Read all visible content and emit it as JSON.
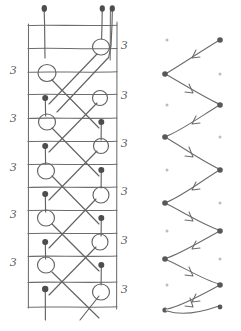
{
  "figure": {
    "ink_color": "#6a6a6a",
    "dark_node_color": "#4a4a4a",
    "faint_node_color": "#b9b9b9",
    "background": "#ffffff"
  },
  "left_panel": {
    "name": "braid-ladder",
    "grid": {
      "x_left": 28,
      "x_right": 117,
      "y_top": 25,
      "y_bottom": 307,
      "rung_count": 12,
      "rung_ys": [
        25,
        48,
        72,
        94,
        118,
        141,
        164,
        187,
        210,
        233,
        256,
        282,
        307
      ],
      "rail_xs": [
        28,
        117
      ],
      "extra_rail_x": 110
    },
    "top_stubs": [
      {
        "x": 44,
        "y_top": 10,
        "y_bottom": 25,
        "dot": true
      },
      {
        "x": 102,
        "y_top": 10,
        "y_bottom": 25,
        "dot": true
      },
      {
        "x": 112,
        "y_top": 10,
        "y_bottom": 25,
        "dot": true
      }
    ],
    "loops": [
      {
        "cx": 101,
        "cy": 47,
        "r": 8,
        "side": "right"
      },
      {
        "cx": 47,
        "cy": 73,
        "r": 9,
        "side": "left"
      },
      {
        "cx": 100,
        "cy": 98,
        "r": 7,
        "side": "right"
      },
      {
        "cx": 47,
        "cy": 122,
        "r": 8,
        "side": "left"
      },
      {
        "cx": 101,
        "cy": 146,
        "r": 7,
        "side": "right"
      },
      {
        "cx": 46,
        "cy": 171,
        "r": 8,
        "side": "left"
      },
      {
        "cx": 101,
        "cy": 195,
        "r": 8,
        "side": "right"
      },
      {
        "cx": 46,
        "cy": 218,
        "r": 8,
        "side": "left"
      },
      {
        "cx": 100,
        "cy": 242,
        "r": 8,
        "side": "right"
      },
      {
        "cx": 46,
        "cy": 265,
        "r": 8,
        "side": "left"
      },
      {
        "cx": 101,
        "cy": 292,
        "r": 8,
        "side": "right"
      }
    ],
    "filled_nodes": [
      {
        "x": 44,
        "y": 8
      },
      {
        "x": 102,
        "y": 8
      },
      {
        "x": 112,
        "y": 8
      },
      {
        "x": 45,
        "y": 98
      },
      {
        "x": 101,
        "y": 122
      },
      {
        "x": 45,
        "y": 146
      },
      {
        "x": 101,
        "y": 170
      },
      {
        "x": 45,
        "y": 194
      },
      {
        "x": 101,
        "y": 218
      },
      {
        "x": 45,
        "y": 242
      },
      {
        "x": 101,
        "y": 265
      },
      {
        "x": 45,
        "y": 289
      }
    ],
    "left_labels": [
      {
        "text": "3",
        "x": 12,
        "y": 70
      },
      {
        "text": "3",
        "x": 12,
        "y": 118
      },
      {
        "text": "3",
        "x": 12,
        "y": 167
      },
      {
        "text": "3",
        "x": 12,
        "y": 214
      },
      {
        "text": "3",
        "x": 12,
        "y": 262
      }
    ],
    "right_labels": [
      {
        "text": "3",
        "x": 122,
        "y": 45
      },
      {
        "text": "3",
        "x": 122,
        "y": 95
      },
      {
        "text": "3",
        "x": 122,
        "y": 143
      },
      {
        "text": "3",
        "x": 122,
        "y": 191
      },
      {
        "text": "3",
        "x": 122,
        "y": 240
      },
      {
        "text": "3",
        "x": 122,
        "y": 289
      }
    ]
  },
  "right_panel": {
    "name": "zigzag-arrow-graph",
    "left_column_x": 165,
    "right_column_x": 220,
    "dark_nodes": [
      {
        "x": 220,
        "y": 40,
        "col": "right"
      },
      {
        "x": 165,
        "y": 74,
        "col": "left"
      },
      {
        "x": 220,
        "y": 105,
        "col": "right"
      },
      {
        "x": 165,
        "y": 137,
        "col": "left"
      },
      {
        "x": 220,
        "y": 170,
        "col": "right"
      },
      {
        "x": 165,
        "y": 203,
        "col": "left"
      },
      {
        "x": 220,
        "y": 231,
        "col": "right"
      },
      {
        "x": 165,
        "y": 259,
        "col": "left"
      },
      {
        "x": 220,
        "y": 285,
        "col": "right"
      },
      {
        "x": 165,
        "y": 310,
        "col": "left"
      },
      {
        "x": 220,
        "y": 307,
        "col": "right"
      }
    ],
    "faint_nodes": [
      {
        "x": 167,
        "y": 40
      },
      {
        "x": 220,
        "y": 74
      },
      {
        "x": 167,
        "y": 105
      },
      {
        "x": 220,
        "y": 137
      },
      {
        "x": 167,
        "y": 170
      },
      {
        "x": 220,
        "y": 203
      },
      {
        "x": 167,
        "y": 231
      },
      {
        "x": 220,
        "y": 259
      },
      {
        "x": 167,
        "y": 285
      },
      {
        "x": 167,
        "y": 310
      }
    ],
    "arrow_count": 11,
    "arrow_direction_pattern": [
      "left-up-to-left-down",
      "left-down-to-right-down"
    ]
  }
}
